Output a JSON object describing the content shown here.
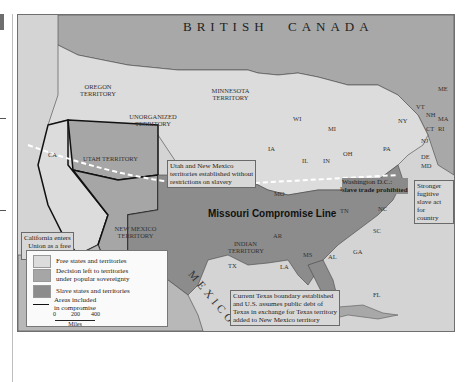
{
  "map": {
    "title_regions": {
      "british": "BRITISH",
      "canada": "CANADA",
      "mexico": "MEXICO"
    },
    "territories": [
      {
        "name": "OREGON TERRITORY",
        "status": "free"
      },
      {
        "name": "MINNESOTA TERRITORY",
        "status": "free"
      },
      {
        "name": "UNORGANIZED TERRITORY",
        "status": "free"
      },
      {
        "name": "UTAH TERRITORY",
        "status": "popular_sovereignty"
      },
      {
        "name": "NEW MEXICO TERRITORY",
        "status": "popular_sovereignty"
      },
      {
        "name": "INDIAN TERRITORY",
        "status": "slave"
      }
    ],
    "states": {
      "free": [
        "CA",
        "IA",
        "WI",
        "MI",
        "IL",
        "IN",
        "OH",
        "PA",
        "NY",
        "VT",
        "NH",
        "ME",
        "MA",
        "RI",
        "CT",
        "NJ"
      ],
      "slave": [
        "MO",
        "KY",
        "VA",
        "TN",
        "NC",
        "SC",
        "GA",
        "AL",
        "MS",
        "AR",
        "LA",
        "TX",
        "FL",
        "DE",
        "MD"
      ]
    },
    "lines": {
      "missouri_compromise": "Missouri Compromise Line"
    },
    "annotations": {
      "utah_nm": "Utah and New Mexico territories established without restrictions on slavery",
      "california": "California enters Union as a free state in 1848",
      "dc": "Washington D.C.: slave trade prohibited",
      "fugitive": "Stronger fugitive slave act for country",
      "texas": "Current Texas boundary established and U.S. assumes public debt of Texas in exchange for Texas territory added to New Mexico territory"
    },
    "annotation_lines": {
      "utah_nm": [
        "Utah and New Mexico",
        "territories established without",
        "restrictions on slavery"
      ],
      "california": [
        "California enters",
        "Union as a free",
        "state in 1848"
      ],
      "dc": [
        "Washington D.C.:",
        "slave trade prohibited"
      ],
      "fugitive": [
        "Stronger fugitive",
        "slave act for",
        "country"
      ],
      "texas": [
        "Current Texas boundary established",
        "and U.S. assumes public debt of",
        "Texas in exchange for Texas territory",
        "added to New Mexico territory"
      ]
    }
  },
  "legend": {
    "items": [
      {
        "label": "Free states and territories",
        "color": "#dcdcdc"
      },
      {
        "label_lines": [
          "Decision left to territories",
          "under popular sovereignty"
        ],
        "color": "#a6a6a6"
      },
      {
        "label": "Slave states and territories",
        "color": "#8c8c8c"
      },
      {
        "label_lines": [
          "Areas included",
          "in compromise"
        ],
        "symbol": "line"
      }
    ],
    "scale": {
      "ticks": [
        "0",
        "200",
        "400"
      ],
      "unit": "Miles"
    }
  },
  "colors": {
    "free": "#dcdcdc",
    "popular_sovereignty": "#a6a6a6",
    "slave": "#8c8c8c",
    "canada": "#a8a8a8",
    "water": "#d4d4d4",
    "mexico": "#b8b8b8"
  }
}
